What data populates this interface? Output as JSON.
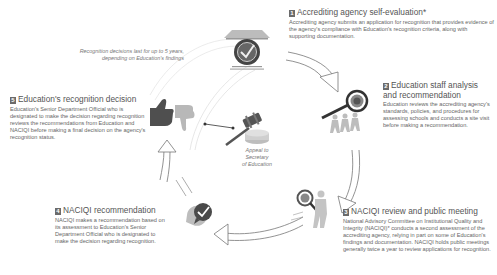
{
  "diagram": {
    "note": {
      "line1": "Recognition decisions last for up to 5 years,",
      "line2": "depending on Education's findings"
    },
    "appeal": {
      "line1": "Appeal to",
      "line2": "Secretary",
      "line3": "of Education"
    },
    "steps": [
      {
        "number": "1",
        "title": "Accrediting agency self-evaluation*",
        "body": "Accrediting agency submits an application for recognition that provides evidence of the agency's compliance with Education's recognition criteria, along with supporting documentation.",
        "icon": "certificate-seal-icon"
      },
      {
        "number": "2",
        "title_line1": "Education staff analysis",
        "title_line2": "and recommendation",
        "body": "Education reviews the accrediting agency's standards, policies, and procedures for assessing schools and conducts a site visit before making a recommendation.",
        "icon": "people-magnifier-icon"
      },
      {
        "number": "3",
        "title": "NACIQI review and public meeting",
        "body": "National Advisory Committee on Institutional Quality and Integrity (NACIQI)* conducts a second assessment of the accrediting agency, relying in part on some of Education's findings and documentation. NACIQI holds public meetings generally twice a year to review applications for recognition.",
        "icon": "person-magnifier-icon"
      },
      {
        "number": "4",
        "title": "NACIQI recommendation",
        "body": "NACIQI makes a recommendation based on its assessment to Education's Senior Department Official who is designated to make the decision regarding recognition.",
        "icon": "speaking-head-checkmark-icon"
      },
      {
        "number": "5",
        "title": "Education's recognition decision",
        "body": "Education's Senior Department Official who is designated to make the decision regarding recognition reviews the recommendations from Education and NACIQI before making a final decision on the agency's recognition status.",
        "icon": "thumbs-up-down-icon"
      }
    ],
    "colors": {
      "dark_gray": "#5a5a5a",
      "mid_gray": "#8a8a8a",
      "light_gray": "#b8b8b8",
      "text": "#555555"
    }
  }
}
